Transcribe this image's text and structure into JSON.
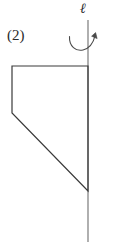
{
  "figure": {
    "part_label": "(2)",
    "axis_label": "ℓ",
    "background_color": "#ffffff",
    "stroke_color": "#3a3a3a",
    "axis_color": "#6e6e6e",
    "label_color": "#2b2b2b",
    "caption": "",
    "axis": {
      "name": "axis-of-rotation",
      "orientation": "vertical",
      "x": 88,
      "y_top": 20,
      "y_bottom": 242,
      "stroke_width": 1.1
    },
    "rotation_arrow": {
      "name": "rotation-arrow",
      "direction": "counterclockwise-sweep-to-right",
      "start": [
        69,
        37
      ],
      "end": [
        96,
        33
      ],
      "arrowhead_at": "end"
    },
    "shape": {
      "name": "trapezoid-region",
      "closed": true,
      "fill": "none",
      "stroke_width": 1.2,
      "vertices": [
        [
          12,
          66
        ],
        [
          88,
          66
        ],
        [
          88,
          191
        ],
        [
          12,
          113
        ]
      ],
      "edges": [
        {
          "name": "top-edge",
          "from": [
            12,
            66
          ],
          "to": [
            88,
            66
          ],
          "type": "horizontal"
        },
        {
          "name": "right-edge-on-axis",
          "from": [
            88,
            66
          ],
          "to": [
            88,
            191
          ],
          "type": "vertical"
        },
        {
          "name": "diagonal-edge",
          "from": [
            88,
            191
          ],
          "to": [
            12,
            113
          ],
          "type": "slant"
        },
        {
          "name": "left-edge",
          "from": [
            12,
            113
          ],
          "to": [
            12,
            66
          ],
          "type": "vertical"
        }
      ]
    }
  }
}
